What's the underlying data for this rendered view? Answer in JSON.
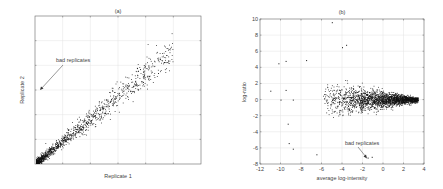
{
  "chart_data": [
    {
      "type": "scatter",
      "title": "(a)",
      "xlabel": "Replicate 1",
      "ylabel": "Replicate 2",
      "xticks": [],
      "yticks": [],
      "grid": true,
      "annotation": {
        "text": "bad replicates",
        "arrow_to": "upper-left near y-axis"
      },
      "description": "Dense cluster of points along the diagonal from the origin, spreading wider at higher values; strong positive correlation between replicates."
    },
    {
      "type": "scatter",
      "title": "(b)",
      "xlabel": "average log-intensity",
      "ylabel": "log-ratio",
      "xlim": [
        -12,
        4
      ],
      "ylim": [
        -8,
        10
      ],
      "xticks": [
        "-12",
        "-10",
        "-8",
        "-6",
        "-4",
        "-2",
        "0",
        "2",
        "4"
      ],
      "yticks": [
        "-8",
        "-6",
        "-4",
        "-2",
        "0",
        "2",
        "4",
        "6",
        "8",
        "10"
      ],
      "grid": true,
      "annotation": {
        "text": "bad replicates",
        "arrow_to": [
          -1.5,
          -7.2
        ]
      },
      "description": "MA plot: points concentrated around log-ratio 0, funnel-shaped with high variance at low intensity (-6 to -2) narrowing toward intensity 3.5.",
      "notable_points": [
        [
          -5,
          9.6
        ],
        [
          -3.6,
          6.8
        ],
        [
          -4,
          6.5
        ],
        [
          -9.5,
          4.8
        ],
        [
          -10.2,
          4.5
        ],
        [
          -7.5,
          4.9
        ],
        [
          -11,
          1.1
        ],
        [
          -9.5,
          1.2
        ],
        [
          -10,
          0
        ],
        [
          -8.8,
          0
        ],
        [
          -9.3,
          -3
        ],
        [
          -9.2,
          -5.4
        ],
        [
          -8.8,
          -6.1
        ],
        [
          -6.5,
          -6.8
        ],
        [
          -1.5,
          -7.2
        ],
        [
          -1.1,
          -7.1
        ]
      ]
    }
  ],
  "panel_a": {
    "title": "(a)",
    "xlabel": "Replicate 1",
    "ylabel": "Replicate 2",
    "annotation": "bad replicates"
  },
  "panel_b": {
    "title": "(b)",
    "xlabel": "average log-intensity",
    "ylabel": "log-ratio",
    "annotation": "bad replicates",
    "xticks": [
      "-12",
      "-10",
      "-8",
      "-6",
      "-4",
      "-2",
      "0",
      "2",
      "4"
    ],
    "yticks": [
      "-8",
      "-6",
      "-4",
      "-2",
      "0",
      "2",
      "4",
      "6",
      "8",
      "10"
    ]
  }
}
